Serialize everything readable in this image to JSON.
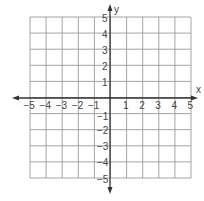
{
  "diagram": {
    "type": "coordinate-grid",
    "x_axis": {
      "label": "x",
      "min": -5,
      "max": 5,
      "ticks": [
        "−5",
        "−4",
        "−3",
        "−2",
        "−1",
        "1",
        "2",
        "3",
        "4",
        "5"
      ]
    },
    "y_axis": {
      "label": "y",
      "min": -5,
      "max": 5,
      "ticks_pos": [
        "5",
        "4",
        "3",
        "2",
        "1"
      ],
      "ticks_neg": [
        "−1",
        "−2",
        "−3",
        "−4",
        "−5"
      ]
    },
    "colors": {
      "grid": "#9a9a9a",
      "axis": "#333333",
      "text": "#444444"
    }
  }
}
